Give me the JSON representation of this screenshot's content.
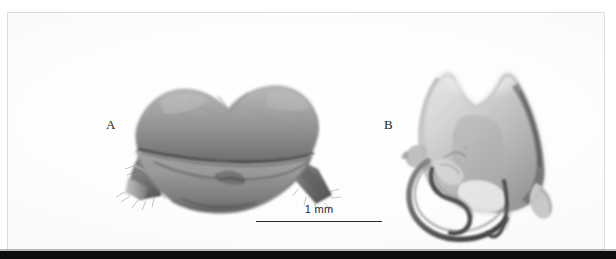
{
  "figure": {
    "type": "scientific-photographic-plate",
    "background_color": "#ffffff",
    "frame_color": "#dcdcdc",
    "bottom_bar_color": "#0d0d0d",
    "panels": [
      {
        "label": "A",
        "subject": "insect-genitalia-ventral-view",
        "description": "wide bilobed sclerite with two lateral segmented appendages bearing setae",
        "tone": "grayscale"
      },
      {
        "label": "B",
        "subject": "insect-genitalia-shield-plate",
        "description": "shield-shaped plate with median apical notch and curved hook-like processes at lower left",
        "tone": "grayscale"
      }
    ],
    "scale_bar": {
      "label": "1 mm",
      "length_px": 126,
      "line_color": "#2b2b2b"
    }
  }
}
